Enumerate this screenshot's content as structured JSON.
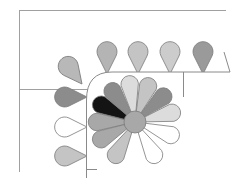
{
  "diagram": {
    "colors": {
      "background": "#ffffff",
      "frame_line": "#9a9a9a",
      "outline": "#7a7a7a",
      "black": "#141414",
      "dark_gray": "#8c8c8c",
      "mid_gray": "#a8a8a8",
      "light_gray": "#c4c4c4",
      "pale_gray": "#dcdcdc",
      "white": "#ffffff"
    },
    "fan": {
      "center": [
        135,
        122
      ],
      "radius": 48,
      "hub_radius": 11,
      "blades": [
        {
          "name": "blade-1",
          "angle": 180,
          "fill": "#a8a8a8"
        },
        {
          "name": "blade-2",
          "angle": 207,
          "fill": "#141414"
        },
        {
          "name": "blade-3",
          "angle": 234,
          "fill": "#8c8c8c"
        },
        {
          "name": "blade-4",
          "angle": 262,
          "fill": "#dcdcdc"
        },
        {
          "name": "blade-5",
          "angle": 290,
          "fill": "#c4c4c4"
        },
        {
          "name": "blade-6",
          "angle": 318,
          "fill": "#8c8c8c"
        },
        {
          "name": "blade-7",
          "angle": 346,
          "fill": "#dcdcdc"
        },
        {
          "name": "blade-8",
          "angle": 20,
          "fill": "#ffffff"
        },
        {
          "name": "blade-9",
          "angle": 60,
          "fill": "#ffffff"
        },
        {
          "name": "blade-10",
          "angle": 120,
          "fill": "#c4c4c4"
        },
        {
          "name": "blade-11",
          "angle": 153,
          "fill": "#a8a8a8"
        }
      ],
      "hub_fill": "#a8a8a8"
    },
    "top_petals": [
      {
        "name": "top-petal-1",
        "x": 107,
        "y": 58,
        "rotate": 0,
        "fill": "#b4b4b4"
      },
      {
        "name": "top-petal-2",
        "x": 138,
        "y": 58,
        "rotate": 0,
        "fill": "#c4c4c4"
      },
      {
        "name": "top-petal-3",
        "x": 170,
        "y": 58,
        "rotate": 0,
        "fill": "#cccccc"
      },
      {
        "name": "top-petal-4",
        "x": 203,
        "y": 58,
        "rotate": 0,
        "fill": "#9a9a9a"
      }
    ],
    "corner_petal": {
      "name": "corner-petal",
      "x": 82,
      "y": 68,
      "rotate": -38,
      "fill": "#b8b8b8"
    },
    "left_petals": [
      {
        "name": "left-petal-1",
        "x": 70,
        "y": 97,
        "rotate": -90,
        "fill": "#8c8c8c"
      },
      {
        "name": "left-petal-2",
        "x": 70,
        "y": 127,
        "rotate": -90,
        "fill": "#ffffff"
      },
      {
        "name": "left-petal-3",
        "x": 70,
        "y": 156,
        "rotate": -90,
        "fill": "#c4c4c4"
      }
    ]
  }
}
